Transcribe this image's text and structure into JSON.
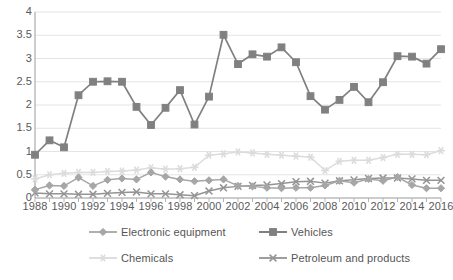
{
  "chart_data": {
    "type": "line",
    "title": "",
    "subtitle": "",
    "xlabel": "",
    "ylabel": "",
    "grid": true,
    "legend_position": "bottom",
    "ylim": [
      0,
      4
    ],
    "xlim": [
      1988,
      2016
    ],
    "y_ticks": [
      "0",
      "0.5",
      "1",
      "1.5",
      "2",
      "2.5",
      "3",
      "3.5",
      "4"
    ],
    "y_tick_values": [
      0,
      0.5,
      1,
      1.5,
      2,
      2.5,
      3,
      3.5,
      4
    ],
    "x_tick_labels": [
      "1988",
      "1990",
      "1992",
      "1994",
      "1996",
      "1998",
      "2000",
      "2002",
      "2004",
      "2006",
      "2008",
      "2010",
      "2012",
      "2014",
      "2016"
    ],
    "x_tick_values": [
      1988,
      1990,
      1992,
      1994,
      1996,
      1998,
      2000,
      2002,
      2004,
      2006,
      2008,
      2010,
      2012,
      2014,
      2016
    ],
    "x": [
      1988,
      1989,
      1990,
      1991,
      1992,
      1993,
      1994,
      1995,
      1996,
      1997,
      1998,
      1999,
      2000,
      2001,
      2002,
      2003,
      2004,
      2005,
      2006,
      2007,
      2008,
      2009,
      2010,
      2011,
      2012,
      2013,
      2014,
      2015,
      2016
    ],
    "series": [
      {
        "name": "Electronic equipment",
        "color": "#a6a6a6",
        "marker": "diamond",
        "values": [
          0.18,
          0.27,
          0.26,
          0.44,
          0.26,
          0.39,
          0.42,
          0.4,
          0.55,
          0.46,
          0.4,
          0.36,
          0.38,
          0.4,
          0.26,
          0.25,
          0.22,
          0.21,
          0.22,
          0.22,
          0.27,
          0.37,
          0.33,
          0.41,
          0.37,
          0.45,
          0.28,
          0.21,
          0.21
        ]
      },
      {
        "name": "Vehicles",
        "color": "#808080",
        "marker": "square",
        "values": [
          0.93,
          1.24,
          1.09,
          2.21,
          2.5,
          2.51,
          2.5,
          1.96,
          1.57,
          1.94,
          2.32,
          1.58,
          2.18,
          3.51,
          2.88,
          3.09,
          3.04,
          3.24,
          2.92,
          2.19,
          1.9,
          2.11,
          2.39,
          2.06,
          2.49,
          3.05,
          3.04,
          2.89,
          3.2
        ]
      },
      {
        "name": "Chemicals",
        "color": "#dcdcdc",
        "marker": "star",
        "values": [
          0.41,
          0.5,
          0.53,
          0.55,
          0.55,
          0.57,
          0.58,
          0.6,
          0.65,
          0.62,
          0.63,
          0.66,
          0.92,
          0.95,
          0.99,
          0.97,
          0.94,
          0.92,
          0.9,
          0.88,
          0.59,
          0.79,
          0.81,
          0.81,
          0.87,
          0.94,
          0.94,
          0.93,
          1.02
        ]
      },
      {
        "name": "Petroleum and products",
        "color": "#949494",
        "marker": "cross",
        "values": [
          0.11,
          0.09,
          0.09,
          0.08,
          0.08,
          0.1,
          0.12,
          0.13,
          0.09,
          0.09,
          0.07,
          0.05,
          0.15,
          0.22,
          0.25,
          0.27,
          0.28,
          0.31,
          0.35,
          0.36,
          0.32,
          0.37,
          0.39,
          0.42,
          0.43,
          0.43,
          0.41,
          0.38,
          0.38
        ]
      }
    ]
  },
  "legend": {
    "items": [
      {
        "label": "Electronic equipment"
      },
      {
        "label": "Vehicles"
      },
      {
        "label": "Chemicals"
      },
      {
        "label": "Petroleum and products"
      }
    ]
  }
}
